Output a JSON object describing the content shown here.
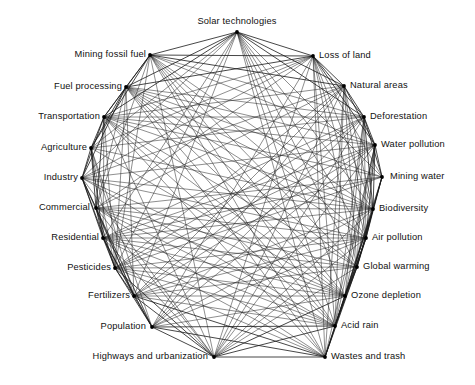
{
  "figure": {
    "type": "network-diagram",
    "title": "",
    "background_color": "#ffffff",
    "edge_color": "#1a1a1a",
    "node_color": "#000000",
    "label_color": "#111111"
  },
  "chart_data": {
    "type": "graph",
    "layout": "circular",
    "title": "",
    "xlabel": "",
    "ylabel": "",
    "grid": false,
    "legend": "none",
    "node_count": 20,
    "nodes": [
      {
        "id": "solar-technologies",
        "label": "Solar technologies",
        "x": 237,
        "y": 32,
        "anchor": "top",
        "lx": 237,
        "ly": 26
      },
      {
        "id": "loss-of-land",
        "label": "Loss of land",
        "x": 313,
        "y": 56,
        "anchor": "right",
        "lx": 319,
        "ly": 55
      },
      {
        "id": "natural-areas",
        "label": "Natural areas",
        "x": 344,
        "y": 86,
        "anchor": "right",
        "lx": 350,
        "ly": 85
      },
      {
        "id": "deforestation",
        "label": "Deforestation",
        "x": 364,
        "y": 117,
        "anchor": "right",
        "lx": 370,
        "ly": 116
      },
      {
        "id": "water-pollution",
        "label": "Water pollution",
        "x": 375,
        "y": 145,
        "anchor": "right",
        "lx": 381,
        "ly": 144
      },
      {
        "id": "mining-water",
        "label": "Mining water",
        "x": 382,
        "y": 177,
        "anchor": "right",
        "lx": 390,
        "ly": 176
      },
      {
        "id": "biodiversity",
        "label": "Biodiversity",
        "x": 373,
        "y": 209,
        "anchor": "right",
        "lx": 379,
        "ly": 208
      },
      {
        "id": "air-pollution",
        "label": "Air pollution",
        "x": 366,
        "y": 238,
        "anchor": "right",
        "lx": 372,
        "ly": 237
      },
      {
        "id": "global-warming",
        "label": "Global warming",
        "x": 357,
        "y": 267,
        "anchor": "right",
        "lx": 363,
        "ly": 266
      },
      {
        "id": "ozone-depletion",
        "label": "Ozone depletion",
        "x": 345,
        "y": 296,
        "anchor": "right",
        "lx": 351,
        "ly": 295
      },
      {
        "id": "acid-rain",
        "label": "Acid rain",
        "x": 335,
        "y": 326,
        "anchor": "right",
        "lx": 341,
        "ly": 325
      },
      {
        "id": "wastes-and-trash",
        "label": "Wastes and trash",
        "x": 325,
        "y": 357,
        "anchor": "right",
        "lx": 331,
        "ly": 356
      },
      {
        "id": "highways-and-urbanization",
        "label": "Highways and urbanization",
        "x": 214,
        "y": 357,
        "anchor": "left",
        "lx": 208,
        "ly": 356
      },
      {
        "id": "population",
        "label": "Population",
        "x": 152,
        "y": 327,
        "anchor": "left",
        "lx": 146,
        "ly": 326
      },
      {
        "id": "fertilizers",
        "label": "Fertilizers",
        "x": 134,
        "y": 296,
        "anchor": "left",
        "lx": 130,
        "ly": 295
      },
      {
        "id": "pesticides",
        "label": "Pesticides",
        "x": 115,
        "y": 268,
        "anchor": "left",
        "lx": 111,
        "ly": 267
      },
      {
        "id": "residential",
        "label": "Residential",
        "x": 103,
        "y": 238,
        "anchor": "left",
        "lx": 99,
        "ly": 237
      },
      {
        "id": "commercial",
        "label": "Commercial",
        "x": 96,
        "y": 208,
        "anchor": "left",
        "lx": 90,
        "ly": 207
      },
      {
        "id": "industry",
        "label": "Industry",
        "x": 82,
        "y": 178,
        "anchor": "left",
        "lx": 78,
        "ly": 177
      },
      {
        "id": "agriculture",
        "label": "Agriculture",
        "x": 91,
        "y": 148,
        "anchor": "left",
        "lx": 87,
        "ly": 147
      },
      {
        "id": "transportation",
        "label": "Transportation",
        "x": 104,
        "y": 117,
        "anchor": "left",
        "lx": 100,
        "ly": 116
      },
      {
        "id": "fuel-processing",
        "label": "Fuel processing",
        "x": 126,
        "y": 87,
        "anchor": "left",
        "lx": 122,
        "ly": 86
      },
      {
        "id": "mining-fossil-fuel",
        "label": "Mining fossil fuel",
        "x": 150,
        "y": 55,
        "anchor": "left",
        "lx": 146,
        "ly": 54
      }
    ]
  }
}
